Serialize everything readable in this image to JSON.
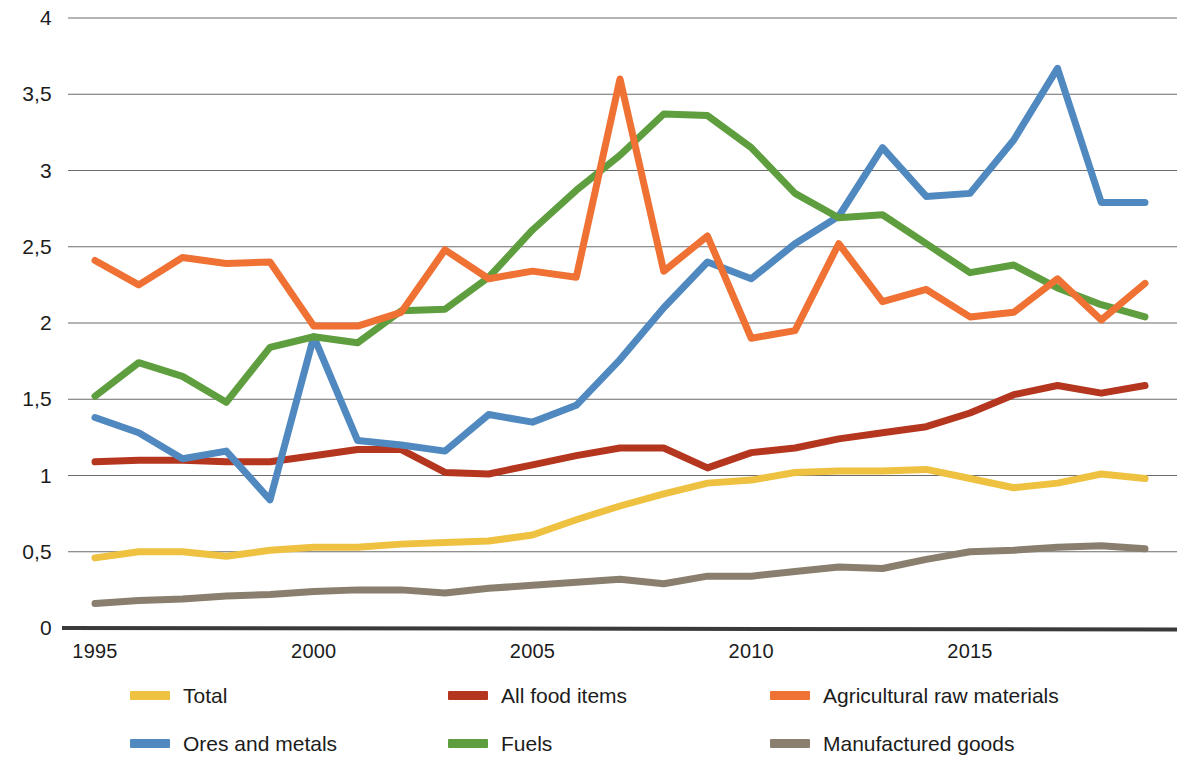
{
  "chart_data": {
    "type": "line",
    "title": "",
    "subtitle": "",
    "xlabel": "",
    "ylabel": "",
    "xlim": [
      1995,
      2019
    ],
    "ylim": [
      0,
      4
    ],
    "grid": true,
    "legend_position": "bottom",
    "x": [
      1995,
      1996,
      1997,
      1998,
      1999,
      2000,
      2001,
      2002,
      2003,
      2004,
      2005,
      2006,
      2007,
      2008,
      2009,
      2010,
      2011,
      2012,
      2013,
      2014,
      2015,
      2016,
      2017,
      2018,
      2019
    ],
    "x_tick_labels": [
      "1995",
      "2000",
      "2005",
      "2010",
      "2015"
    ],
    "x_ticks": [
      1995,
      2000,
      2005,
      2010,
      2015
    ],
    "y_tick_labels": [
      "0",
      "0,5",
      "1",
      "1,5",
      "2",
      "2,5",
      "3",
      "3,5",
      "4"
    ],
    "y_ticks": [
      0,
      0.5,
      1,
      1.5,
      2,
      2.5,
      3,
      3.5,
      4
    ],
    "series": [
      {
        "name": "Total",
        "color": "#EFC141",
        "values": [
          0.46,
          0.5,
          0.5,
          0.47,
          0.51,
          0.53,
          0.53,
          0.55,
          0.56,
          0.57,
          0.61,
          0.71,
          0.8,
          0.88,
          0.95,
          0.97,
          1.02,
          1.03,
          1.03,
          1.04,
          0.98,
          0.92,
          0.95,
          1.01,
          0.98
        ]
      },
      {
        "name": "All food items",
        "color": "#B5361F",
        "values": [
          1.09,
          1.1,
          1.1,
          1.09,
          1.09,
          1.13,
          1.17,
          1.17,
          1.02,
          1.01,
          1.07,
          1.13,
          1.18,
          1.18,
          1.05,
          1.15,
          1.18,
          1.24,
          1.28,
          1.32,
          1.41,
          1.53,
          1.59,
          1.54,
          1.59
        ]
      },
      {
        "name": "Agricultural raw materials",
        "color": "#EF7133",
        "values": [
          2.41,
          2.25,
          2.43,
          2.39,
          2.4,
          1.98,
          1.98,
          2.07,
          2.48,
          2.29,
          2.34,
          2.3,
          3.6,
          2.34,
          2.57,
          1.9,
          1.95,
          2.52,
          2.14,
          2.22,
          2.04,
          2.07,
          2.29,
          2.02,
          2.26
        ]
      },
      {
        "name": "Ores and metals",
        "color": "#5089C0",
        "values": [
          1.38,
          1.28,
          1.11,
          1.16,
          0.84,
          1.91,
          1.23,
          1.2,
          1.16,
          1.4,
          1.35,
          1.46,
          1.76,
          2.1,
          2.4,
          2.29,
          2.52,
          2.7,
          3.15,
          2.83,
          2.85,
          3.2,
          3.67,
          2.79,
          2.79
        ]
      },
      {
        "name": "Fuels",
        "color": "#5E9E3E",
        "values": [
          1.52,
          1.74,
          1.65,
          1.48,
          1.84,
          1.91,
          1.87,
          2.08,
          2.09,
          2.3,
          2.61,
          2.87,
          3.1,
          3.37,
          3.36,
          3.15,
          2.85,
          2.69,
          2.71,
          2.52,
          2.33,
          2.38,
          2.23,
          2.12,
          2.04
        ]
      },
      {
        "name": "Manufactured goods",
        "color": "#8A7F6E",
        "values": [
          0.16,
          0.18,
          0.19,
          0.21,
          0.22,
          0.24,
          0.25,
          0.25,
          0.23,
          0.26,
          0.28,
          0.3,
          0.32,
          0.29,
          0.34,
          0.34,
          0.37,
          0.4,
          0.39,
          0.45,
          0.5,
          0.51,
          0.53,
          0.54,
          0.52
        ]
      }
    ]
  },
  "legend": {
    "items": [
      {
        "label": "Total",
        "color": "#EFC141"
      },
      {
        "label": "All food items",
        "color": "#B5361F"
      },
      {
        "label": "Agricultural raw materials",
        "color": "#EF7133"
      },
      {
        "label": "Ores and metals",
        "color": "#5089C0"
      },
      {
        "label": "Fuels",
        "color": "#5E9E3E"
      },
      {
        "label": "Manufactured goods",
        "color": "#8A7F6E"
      }
    ]
  },
  "axis": {
    "baseline_color": "#3a3a3a",
    "gridline_color": "#6b6b6b"
  }
}
